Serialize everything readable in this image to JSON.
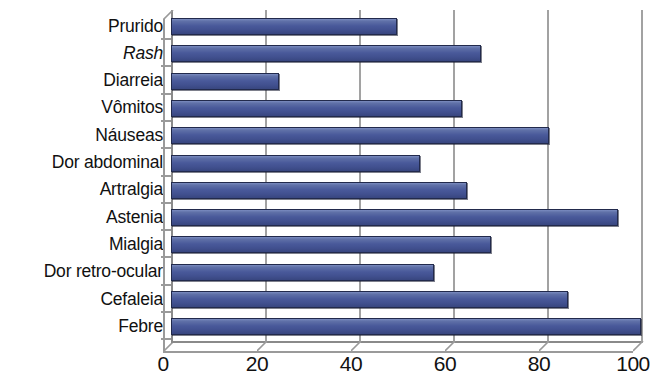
{
  "chart_data": {
    "type": "bar",
    "orientation": "horizontal",
    "title": "",
    "subtitle": "",
    "xlabel": "",
    "ylabel": "",
    "categories": [
      "Prurido",
      "Rash",
      "Diarreia",
      "Vômitos",
      "Náuseas",
      "Dor abdominal",
      "Artralgia",
      "Astenia",
      "Mialgia",
      "Dor retro-ocular",
      "Cefaleia",
      "Febre"
    ],
    "values": [
      48,
      66,
      23,
      62,
      80.5,
      53,
      63,
      95,
      68,
      56,
      84.5,
      100
    ],
    "xlim": [
      0,
      100
    ],
    "xticks": [
      0,
      20,
      40,
      60,
      80,
      100
    ],
    "xtick_labels": [
      "0",
      "20",
      "40",
      "60",
      "80",
      "100"
    ],
    "grid": true,
    "grid_axis": "x",
    "legend": false,
    "legend_position": "none",
    "series": [
      {
        "name": "",
        "values": [
          48,
          66,
          23,
          62,
          80.5,
          53,
          63,
          95,
          68,
          56,
          84.5,
          100
        ]
      }
    ],
    "italic_categories": [
      "Rash"
    ],
    "bar_color": "#49599a",
    "bar_edge_color": "#222a4c",
    "axis_color": "#8a8a8a",
    "grid_color": "#a2a2a2",
    "background_color": "#ffffff",
    "style": "3d-bar"
  }
}
